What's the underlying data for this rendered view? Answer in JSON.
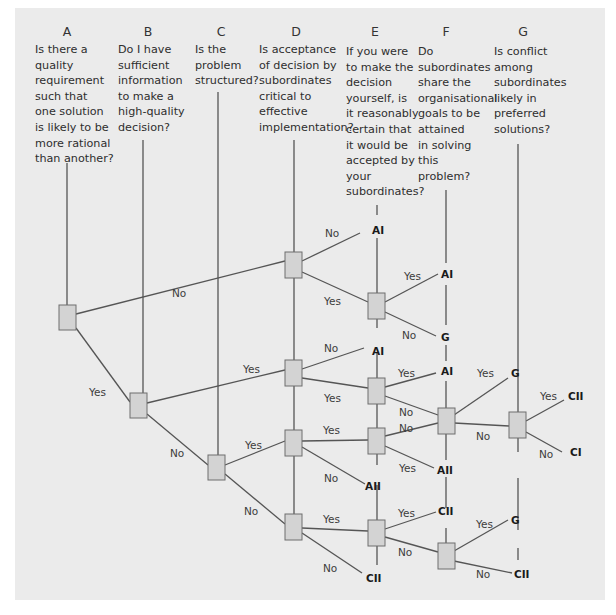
{
  "columns": [
    {
      "letter": "A",
      "question": "Is there a\nquality\nrequirement\nsuch that\none solution\nis likely to be\nmore rational\nthan another?"
    },
    {
      "letter": "B",
      "question": "Do I have\nsufficient\ninformation\nto make a\nhigh-quality\ndecision?"
    },
    {
      "letter": "C",
      "question": "Is the\nproblem\nstructured?"
    },
    {
      "letter": "D",
      "question": "Is acceptance\nof decision by\nsubordinates\ncritical to\neffective\nimplementation?"
    },
    {
      "letter": "E",
      "question": "If you were\nto make the\ndecision\nyourself, is\nit reasonably\ncertain that\nit would be\naccepted by\nyour\nsubordinates?"
    },
    {
      "letter": "F",
      "question": "Do\nsubordinates\nshare the\norganisational\ngoals to be\nattained\nin solving\nthis\nproblem?"
    },
    {
      "letter": "G",
      "question": "Is conflict\namong\nsubordinates\nlikely in\npreferred\nsolutions?"
    }
  ],
  "branch_labels": {
    "a_no": "No",
    "a_yes": "Yes",
    "b_yes": "Yes",
    "b_no": "No",
    "c_yes": "Yes",
    "c_no": "No",
    "d1_no": "No",
    "d1_yes": "Yes",
    "e1_yes": "Yes",
    "e1_no": "No",
    "d2_no": "No",
    "d2_yes": "Yes",
    "e2_yes": "Yes",
    "e2_no": "No",
    "d3_yes": "Yes",
    "d3_no": "No",
    "e3_no": "No",
    "e3_yes": "Yes",
    "f1_yes": "Yes",
    "f1_no": "No",
    "g1_yes": "Yes",
    "g1_no": "No",
    "d4_yes": "Yes",
    "d4_no": "No",
    "e4_yes": "Yes",
    "e4_no": "No",
    "f2_yes": "Yes",
    "f2_no": "No"
  },
  "outcomes": {
    "d1_no": "AI",
    "e1_yes": "AI",
    "e1_no": "G",
    "d2_no": "AI",
    "e2_yes": "AI",
    "d3_no": "AII",
    "e3_yes": "AII",
    "f1_yes": "G",
    "g1_yes": "CII",
    "g1_no": "CI",
    "e4_yes": "CII",
    "d4_no": "CII",
    "f2_yes": "G",
    "f2_no": "CII"
  }
}
